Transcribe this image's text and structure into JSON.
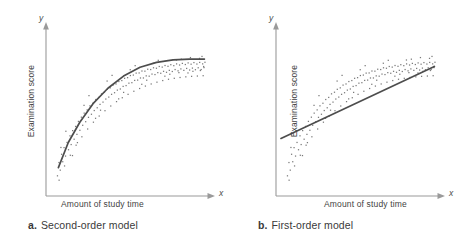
{
  "figure": {
    "background": "#ffffff",
    "axis_color": "#9a9a9a",
    "curve_color": "#4d4d4d",
    "point_color": "#7a7a7a"
  },
  "panels": [
    {
      "id": "a",
      "tag": "a.",
      "caption": "Second-order model",
      "x_axis_letter": "x",
      "y_axis_letter": "y",
      "x_label": "Amount of study time",
      "y_label": "Examination score"
    },
    {
      "id": "b",
      "tag": "b.",
      "caption": "First-order model",
      "x_axis_letter": "x",
      "y_axis_letter": "y",
      "x_label": "Amount of study time",
      "y_label": "Examination score"
    }
  ],
  "chart_data": [
    {
      "type": "scatter",
      "title": "Second-order model",
      "xlabel": "Amount of study time",
      "ylabel": "Examination score",
      "xlim": [
        0,
        1
      ],
      "ylim": [
        0,
        1
      ],
      "grid": false,
      "legend": null,
      "axis_ticks": false,
      "fit": {
        "name": "second-order (quadratic) regression curve",
        "shape": "concave-down, rising steeply then plateauing",
        "path_points": [
          [
            0.075,
            0.175
          ],
          [
            0.135,
            0.33
          ],
          [
            0.205,
            0.455
          ],
          [
            0.285,
            0.57
          ],
          [
            0.375,
            0.665
          ],
          [
            0.47,
            0.74
          ],
          [
            0.57,
            0.795
          ],
          [
            0.67,
            0.825
          ],
          [
            0.77,
            0.84
          ],
          [
            0.87,
            0.845
          ],
          [
            0.96,
            0.845
          ]
        ]
      },
      "points": [
        [
          0.069,
          0.125
        ],
        [
          0.078,
          0.207
        ],
        [
          0.086,
          0.16
        ],
        [
          0.094,
          0.258
        ],
        [
          0.079,
          0.098
        ],
        [
          0.101,
          0.212
        ],
        [
          0.109,
          0.299
        ],
        [
          0.118,
          0.247
        ],
        [
          0.127,
          0.331
        ],
        [
          0.112,
          0.186
        ],
        [
          0.136,
          0.286
        ],
        [
          0.145,
          0.372
        ],
        [
          0.152,
          0.318
        ],
        [
          0.161,
          0.404
        ],
        [
          0.147,
          0.252
        ],
        [
          0.17,
          0.351
        ],
        [
          0.179,
          0.43
        ],
        [
          0.187,
          0.381
        ],
        [
          0.196,
          0.461
        ],
        [
          0.182,
          0.314
        ],
        [
          0.205,
          0.406
        ],
        [
          0.214,
          0.487
        ],
        [
          0.222,
          0.437
        ],
        [
          0.231,
          0.512
        ],
        [
          0.217,
          0.366
        ],
        [
          0.24,
          0.459
        ],
        [
          0.249,
          0.532
        ],
        [
          0.257,
          0.486
        ],
        [
          0.266,
          0.557
        ],
        [
          0.252,
          0.414
        ],
        [
          0.275,
          0.505
        ],
        [
          0.284,
          0.573
        ],
        [
          0.292,
          0.528
        ],
        [
          0.301,
          0.596
        ],
        [
          0.287,
          0.456
        ],
        [
          0.31,
          0.545
        ],
        [
          0.319,
          0.609
        ],
        [
          0.327,
          0.566
        ],
        [
          0.336,
          0.631
        ],
        [
          0.322,
          0.494
        ],
        [
          0.345,
          0.58
        ],
        [
          0.354,
          0.641
        ],
        [
          0.362,
          0.599
        ],
        [
          0.371,
          0.659
        ],
        [
          0.357,
          0.527
        ],
        [
          0.38,
          0.611
        ],
        [
          0.389,
          0.668
        ],
        [
          0.397,
          0.628
        ],
        [
          0.406,
          0.685
        ],
        [
          0.392,
          0.556
        ],
        [
          0.415,
          0.638
        ],
        [
          0.424,
          0.692
        ],
        [
          0.432,
          0.654
        ],
        [
          0.441,
          0.707
        ],
        [
          0.427,
          0.583
        ],
        [
          0.45,
          0.661
        ],
        [
          0.459,
          0.713
        ],
        [
          0.467,
          0.677
        ],
        [
          0.476,
          0.727
        ],
        [
          0.462,
          0.607
        ],
        [
          0.485,
          0.682
        ],
        [
          0.494,
          0.731
        ],
        [
          0.502,
          0.697
        ],
        [
          0.511,
          0.744
        ],
        [
          0.497,
          0.628
        ],
        [
          0.52,
          0.7
        ],
        [
          0.529,
          0.747
        ],
        [
          0.537,
          0.714
        ],
        [
          0.546,
          0.759
        ],
        [
          0.532,
          0.647
        ],
        [
          0.555,
          0.716
        ],
        [
          0.564,
          0.76
        ],
        [
          0.572,
          0.729
        ],
        [
          0.581,
          0.772
        ],
        [
          0.567,
          0.664
        ],
        [
          0.59,
          0.729
        ],
        [
          0.599,
          0.771
        ],
        [
          0.607,
          0.742
        ],
        [
          0.616,
          0.783
        ],
        [
          0.602,
          0.679
        ],
        [
          0.625,
          0.74
        ],
        [
          0.634,
          0.781
        ],
        [
          0.642,
          0.753
        ],
        [
          0.651,
          0.792
        ],
        [
          0.637,
          0.692
        ],
        [
          0.66,
          0.75
        ],
        [
          0.669,
          0.789
        ],
        [
          0.677,
          0.762
        ],
        [
          0.686,
          0.8
        ],
        [
          0.672,
          0.703
        ],
        [
          0.695,
          0.758
        ],
        [
          0.704,
          0.796
        ],
        [
          0.712,
          0.77
        ],
        [
          0.721,
          0.806
        ],
        [
          0.707,
          0.713
        ],
        [
          0.73,
          0.764
        ],
        [
          0.739,
          0.801
        ],
        [
          0.747,
          0.776
        ],
        [
          0.756,
          0.811
        ],
        [
          0.742,
          0.721
        ],
        [
          0.765,
          0.769
        ],
        [
          0.774,
          0.805
        ],
        [
          0.782,
          0.781
        ],
        [
          0.791,
          0.816
        ],
        [
          0.777,
          0.727
        ],
        [
          0.8,
          0.773
        ],
        [
          0.809,
          0.809
        ],
        [
          0.817,
          0.785
        ],
        [
          0.826,
          0.819
        ],
        [
          0.812,
          0.732
        ],
        [
          0.835,
          0.776
        ],
        [
          0.844,
          0.812
        ],
        [
          0.852,
          0.788
        ],
        [
          0.861,
          0.822
        ],
        [
          0.847,
          0.736
        ],
        [
          0.87,
          0.778
        ],
        [
          0.879,
          0.814
        ],
        [
          0.887,
          0.79
        ],
        [
          0.896,
          0.824
        ],
        [
          0.882,
          0.739
        ],
        [
          0.905,
          0.78
        ],
        [
          0.914,
          0.815
        ],
        [
          0.922,
          0.792
        ],
        [
          0.931,
          0.825
        ],
        [
          0.917,
          0.741
        ],
        [
          0.94,
          0.781
        ],
        [
          0.949,
          0.816
        ],
        [
          0.957,
          0.793
        ],
        [
          0.963,
          0.826
        ],
        [
          0.952,
          0.743
        ],
        [
          0.09,
          0.3
        ],
        [
          0.16,
          0.25
        ],
        [
          0.23,
          0.56
        ],
        [
          0.3,
          0.48
        ],
        [
          0.37,
          0.71
        ],
        [
          0.44,
          0.6
        ],
        [
          0.51,
          0.78
        ],
        [
          0.58,
          0.69
        ],
        [
          0.65,
          0.82
        ],
        [
          0.72,
          0.74
        ],
        [
          0.79,
          0.84
        ],
        [
          0.86,
          0.76
        ],
        [
          0.93,
          0.85
        ],
        [
          0.955,
          0.8
        ],
        [
          0.12,
          0.4
        ],
        [
          0.19,
          0.33
        ],
        [
          0.26,
          0.62
        ],
        [
          0.33,
          0.53
        ],
        [
          0.4,
          0.745
        ],
        [
          0.47,
          0.64
        ],
        [
          0.54,
          0.805
        ],
        [
          0.61,
          0.715
        ],
        [
          0.68,
          0.838
        ],
        [
          0.75,
          0.752
        ],
        [
          0.82,
          0.845
        ],
        [
          0.89,
          0.77
        ],
        [
          0.945,
          0.862
        ],
        [
          0.935,
          0.775
        ],
        [
          0.875,
          0.855
        ],
        [
          0.805,
          0.762
        ]
      ]
    },
    {
      "type": "scatter",
      "title": "First-order model",
      "xlabel": "Amount of study time",
      "ylabel": "Examination score",
      "xlim": [
        0,
        1
      ],
      "ylim": [
        0,
        1
      ],
      "grid": false,
      "legend": null,
      "axis_ticks": false,
      "fit": {
        "name": "first-order (straight-line) regression line",
        "shape": "straight ascending line",
        "path_points": [
          [
            0.03,
            0.355
          ],
          [
            0.96,
            0.8
          ]
        ]
      },
      "points": [
        [
          0.069,
          0.125
        ],
        [
          0.078,
          0.207
        ],
        [
          0.086,
          0.16
        ],
        [
          0.094,
          0.258
        ],
        [
          0.079,
          0.098
        ],
        [
          0.101,
          0.212
        ],
        [
          0.109,
          0.299
        ],
        [
          0.118,
          0.247
        ],
        [
          0.127,
          0.331
        ],
        [
          0.112,
          0.186
        ],
        [
          0.136,
          0.286
        ],
        [
          0.145,
          0.372
        ],
        [
          0.152,
          0.318
        ],
        [
          0.161,
          0.404
        ],
        [
          0.147,
          0.252
        ],
        [
          0.17,
          0.351
        ],
        [
          0.179,
          0.43
        ],
        [
          0.187,
          0.381
        ],
        [
          0.196,
          0.461
        ],
        [
          0.182,
          0.314
        ],
        [
          0.205,
          0.406
        ],
        [
          0.214,
          0.487
        ],
        [
          0.222,
          0.437
        ],
        [
          0.231,
          0.512
        ],
        [
          0.217,
          0.366
        ],
        [
          0.24,
          0.459
        ],
        [
          0.249,
          0.532
        ],
        [
          0.257,
          0.486
        ],
        [
          0.266,
          0.557
        ],
        [
          0.252,
          0.414
        ],
        [
          0.275,
          0.505
        ],
        [
          0.284,
          0.573
        ],
        [
          0.292,
          0.528
        ],
        [
          0.301,
          0.596
        ],
        [
          0.287,
          0.456
        ],
        [
          0.31,
          0.545
        ],
        [
          0.319,
          0.609
        ],
        [
          0.327,
          0.566
        ],
        [
          0.336,
          0.631
        ],
        [
          0.322,
          0.494
        ],
        [
          0.345,
          0.58
        ],
        [
          0.354,
          0.641
        ],
        [
          0.362,
          0.599
        ],
        [
          0.371,
          0.659
        ],
        [
          0.357,
          0.527
        ],
        [
          0.38,
          0.611
        ],
        [
          0.389,
          0.668
        ],
        [
          0.397,
          0.628
        ],
        [
          0.406,
          0.685
        ],
        [
          0.392,
          0.556
        ],
        [
          0.415,
          0.638
        ],
        [
          0.424,
          0.692
        ],
        [
          0.432,
          0.654
        ],
        [
          0.441,
          0.707
        ],
        [
          0.427,
          0.583
        ],
        [
          0.45,
          0.661
        ],
        [
          0.459,
          0.713
        ],
        [
          0.467,
          0.677
        ],
        [
          0.476,
          0.727
        ],
        [
          0.462,
          0.607
        ],
        [
          0.485,
          0.682
        ],
        [
          0.494,
          0.731
        ],
        [
          0.502,
          0.697
        ],
        [
          0.511,
          0.744
        ],
        [
          0.497,
          0.628
        ],
        [
          0.52,
          0.7
        ],
        [
          0.529,
          0.747
        ],
        [
          0.537,
          0.714
        ],
        [
          0.546,
          0.759
        ],
        [
          0.532,
          0.647
        ],
        [
          0.555,
          0.716
        ],
        [
          0.564,
          0.76
        ],
        [
          0.572,
          0.729
        ],
        [
          0.581,
          0.772
        ],
        [
          0.567,
          0.664
        ],
        [
          0.59,
          0.729
        ],
        [
          0.599,
          0.771
        ],
        [
          0.607,
          0.742
        ],
        [
          0.616,
          0.783
        ],
        [
          0.602,
          0.679
        ],
        [
          0.625,
          0.74
        ],
        [
          0.634,
          0.781
        ],
        [
          0.642,
          0.753
        ],
        [
          0.651,
          0.792
        ],
        [
          0.637,
          0.692
        ],
        [
          0.66,
          0.75
        ],
        [
          0.669,
          0.789
        ],
        [
          0.677,
          0.762
        ],
        [
          0.686,
          0.8
        ],
        [
          0.672,
          0.703
        ],
        [
          0.695,
          0.758
        ],
        [
          0.704,
          0.796
        ],
        [
          0.712,
          0.77
        ],
        [
          0.721,
          0.806
        ],
        [
          0.707,
          0.713
        ],
        [
          0.73,
          0.764
        ],
        [
          0.739,
          0.801
        ],
        [
          0.747,
          0.776
        ],
        [
          0.756,
          0.811
        ],
        [
          0.742,
          0.721
        ],
        [
          0.765,
          0.769
        ],
        [
          0.774,
          0.805
        ],
        [
          0.782,
          0.781
        ],
        [
          0.791,
          0.816
        ],
        [
          0.777,
          0.727
        ],
        [
          0.8,
          0.773
        ],
        [
          0.809,
          0.809
        ],
        [
          0.817,
          0.785
        ],
        [
          0.826,
          0.819
        ],
        [
          0.812,
          0.732
        ],
        [
          0.835,
          0.776
        ],
        [
          0.844,
          0.812
        ],
        [
          0.852,
          0.788
        ],
        [
          0.861,
          0.822
        ],
        [
          0.847,
          0.736
        ],
        [
          0.87,
          0.778
        ],
        [
          0.879,
          0.814
        ],
        [
          0.887,
          0.79
        ],
        [
          0.896,
          0.824
        ],
        [
          0.882,
          0.739
        ],
        [
          0.905,
          0.78
        ],
        [
          0.914,
          0.815
        ],
        [
          0.922,
          0.792
        ],
        [
          0.931,
          0.825
        ],
        [
          0.917,
          0.741
        ],
        [
          0.94,
          0.781
        ],
        [
          0.949,
          0.816
        ],
        [
          0.957,
          0.793
        ],
        [
          0.963,
          0.826
        ],
        [
          0.952,
          0.743
        ],
        [
          0.09,
          0.3
        ],
        [
          0.16,
          0.25
        ],
        [
          0.23,
          0.56
        ],
        [
          0.3,
          0.48
        ],
        [
          0.37,
          0.71
        ],
        [
          0.44,
          0.6
        ],
        [
          0.51,
          0.78
        ],
        [
          0.58,
          0.69
        ],
        [
          0.65,
          0.82
        ],
        [
          0.72,
          0.74
        ],
        [
          0.79,
          0.84
        ],
        [
          0.86,
          0.76
        ],
        [
          0.93,
          0.85
        ],
        [
          0.955,
          0.8
        ],
        [
          0.12,
          0.4
        ],
        [
          0.19,
          0.33
        ],
        [
          0.26,
          0.62
        ],
        [
          0.33,
          0.53
        ],
        [
          0.4,
          0.745
        ],
        [
          0.47,
          0.64
        ],
        [
          0.54,
          0.805
        ],
        [
          0.61,
          0.715
        ],
        [
          0.68,
          0.838
        ],
        [
          0.75,
          0.752
        ],
        [
          0.82,
          0.845
        ],
        [
          0.89,
          0.77
        ],
        [
          0.945,
          0.862
        ],
        [
          0.935,
          0.775
        ],
        [
          0.875,
          0.855
        ],
        [
          0.805,
          0.762
        ]
      ]
    }
  ]
}
